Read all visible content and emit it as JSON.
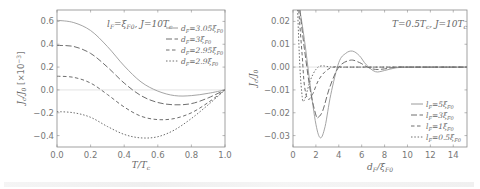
{
  "chart_data": [
    {
      "type": "line",
      "title": "",
      "annotation": "l_F = ξ_F0, J = 10T_c",
      "xlabel": "T/T_c",
      "ylabel": "J_c/J_0 [×10^-3]",
      "xlim": [
        0.0,
        1.0
      ],
      "ylim": [
        -0.5,
        0.7
      ],
      "xticks": [
        "0.0",
        "0.2",
        "0.4",
        "0.6",
        "0.8",
        "1.0"
      ],
      "yticks": [
        "-0.4",
        "-0.2",
        "0.0",
        "0.2",
        "0.4",
        "0.6"
      ],
      "grid": false,
      "legend_position": "upper right",
      "x": [
        0.0,
        0.1,
        0.2,
        0.3,
        0.4,
        0.5,
        0.6,
        0.7,
        0.8,
        0.9,
        1.0
      ],
      "series": [
        {
          "name": "d_F = 3.05ξ_F0",
          "style": "solid",
          "values": [
            0.61,
            0.59,
            0.52,
            0.38,
            0.21,
            0.07,
            -0.01,
            -0.05,
            -0.05,
            -0.03,
            0.0
          ]
        },
        {
          "name": "d_F = 3ξ_F0",
          "style": "dashed",
          "values": [
            0.39,
            0.38,
            0.32,
            0.2,
            0.06,
            -0.05,
            -0.11,
            -0.13,
            -0.12,
            -0.07,
            0.0
          ]
        },
        {
          "name": "d_F = 2.95ξ_F0",
          "style": "dashed-short",
          "values": [
            0.12,
            0.11,
            0.06,
            -0.04,
            -0.15,
            -0.23,
            -0.26,
            -0.25,
            -0.2,
            -0.11,
            0.0
          ]
        },
        {
          "name": "d_F = 2.9ξ_F0",
          "style": "dotted",
          "values": [
            -0.19,
            -0.2,
            -0.24,
            -0.32,
            -0.39,
            -0.42,
            -0.41,
            -0.35,
            -0.25,
            -0.13,
            0.0
          ]
        }
      ]
    },
    {
      "type": "line",
      "title": "",
      "annotation": "T = 0.5T_c, J = 10T_c",
      "xlabel": "d_F/ξ_F0",
      "ylabel": "J_c/J_0",
      "xlim": [
        0,
        15.2
      ],
      "ylim": [
        -0.035,
        0.025
      ],
      "xticks": [
        "0",
        "2",
        "4",
        "6",
        "8",
        "10",
        "12",
        "14"
      ],
      "yticks": [
        "-0.03",
        "-0.02",
        "-0.01",
        "0.00",
        "0.01",
        "0.02"
      ],
      "grid": false,
      "legend_position": "lower right",
      "series": [
        {
          "name": "l_F = 5ξ_F0",
          "style": "solid",
          "x": [
            0.6,
            1.0,
            1.5,
            2.0,
            2.4,
            2.8,
            3.3,
            4.0,
            4.6,
            5.2,
            5.8,
            6.4,
            7.2,
            8.0,
            9.0,
            10,
            11,
            12,
            13,
            14,
            15.2
          ],
          "values": [
            0.025,
            0.012,
            -0.008,
            -0.025,
            -0.031,
            -0.026,
            -0.012,
            0.002,
            0.006,
            0.007,
            0.005,
            0.001,
            -0.002,
            -0.0015,
            -0.0003,
            0.0,
            0.0,
            0.0,
            0.0,
            0.0,
            0.0
          ]
        },
        {
          "name": "l_F = 3ξ_F0",
          "style": "dashed",
          "x": [
            0.6,
            1.0,
            1.5,
            2.0,
            2.2,
            2.6,
            3.2,
            4.0,
            5.0,
            5.8,
            6.5,
            7.2,
            8.0,
            9.0,
            10,
            12,
            15.2
          ],
          "values": [
            0.025,
            0.008,
            -0.01,
            -0.021,
            -0.022,
            -0.019,
            -0.009,
            0.0,
            0.003,
            0.002,
            0.0,
            -0.001,
            -0.0008,
            0.0,
            0.0,
            0.0,
            0.0
          ]
        },
        {
          "name": "l_F = 1ξ_F0",
          "style": "dashed-short",
          "x": [
            0.5,
            0.8,
            1.0,
            1.3,
            1.7,
            2.2,
            2.8,
            3.5,
            4.5,
            6,
            15.2
          ],
          "values": [
            0.025,
            0.005,
            -0.008,
            -0.014,
            -0.012,
            -0.006,
            -0.002,
            0.0,
            0.0,
            0.0,
            0.0
          ]
        },
        {
          "name": "l_F = 0.5ξ_F0",
          "style": "dotted",
          "x": [
            0.4,
            0.6,
            0.8,
            0.9,
            1.1,
            1.5,
            2.0,
            2.5,
            3.5,
            6,
            15.2
          ],
          "values": [
            0.025,
            0.0,
            -0.013,
            -0.015,
            -0.013,
            -0.006,
            -0.001,
            0.0005,
            0.0,
            0.0,
            0.0
          ]
        }
      ]
    }
  ],
  "left": {
    "annotation_main": "l",
    "annotation_sub_F": "F",
    "annotation_eq": "=ξ",
    "annotation_sub_F0": "F0",
    "annotation_rest": ", J=10T",
    "annotation_sub_c": "c",
    "xlabel": "T/T",
    "xlabel_sub": "c",
    "ylabel": "J",
    "ylabel_sub": "c",
    "ylabel_rest": "/J",
    "ylabel_sub0": "0",
    "ylabel_unit": " [×10",
    "ylabel_exp": "−3",
    "ylabel_close": "]",
    "legend": [
      "d_F=3.05ξ_F0",
      "d_F=3ξ_F0",
      "d_F=2.95ξ_F0",
      "d_F=2.9ξ_F0"
    ]
  },
  "right": {
    "annotation": "T=0.5T",
    "annotation_sub": "c",
    "annotation_rest": ",  J=10T",
    "annotation_sub2": "c",
    "xlabel": "d",
    "xlabel_sub": "F",
    "xlabel_rest": "/ξ",
    "xlabel_sub2": "F0",
    "ylabel": "J",
    "ylabel_sub": "c",
    "ylabel_rest": "/J",
    "ylabel_sub0": "0",
    "legend": [
      "l_F=5ξ_F0",
      "l_F=3ξ_F0",
      "l_F=1ξ_F0",
      "l_F=0.5ξ_F0"
    ]
  },
  "colors": {
    "axis": "#8a8a8a",
    "curve": "#6e6e6e",
    "curve_light": "#9a9a9a",
    "zero_line": "#d8d8d8"
  }
}
